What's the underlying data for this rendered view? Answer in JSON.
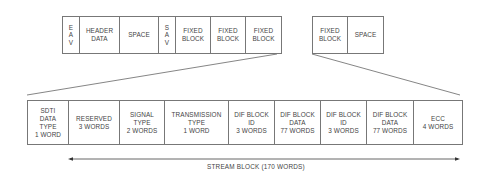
{
  "diagram": {
    "top_row_main": [
      {
        "label": "E\nA\nV",
        "width": 17
      },
      {
        "label": "HEADER\nDATA",
        "width": 40
      },
      {
        "label": "SPACE",
        "width": 39
      },
      {
        "label": "S\nA\nV",
        "width": 17
      },
      {
        "label": "FIXED\nBLOCK",
        "width": 35
      },
      {
        "label": "FIXED\nBLOCK",
        "width": 35
      },
      {
        "label": "FIXED\nBLOCK",
        "width": 35
      }
    ],
    "top_row_secondary": [
      {
        "label": "FIXED\nBLOCK",
        "width": 35
      },
      {
        "label": "SPACE",
        "width": 35
      }
    ],
    "stream_block_fields": [
      {
        "label": "SDTI\nDATA\nTYPE\n1 WORD",
        "width": 41
      },
      {
        "label": "RESERVED\n3 WORDS",
        "width": 51
      },
      {
        "label": "SIGNAL\nTYPE\n2 WORDS",
        "width": 45
      },
      {
        "label": "TRANSMISSION\nTYPE\n1 WORD",
        "width": 64
      },
      {
        "label": "DIF BLOCK\nID\n3 WORDS",
        "width": 46
      },
      {
        "label": "DIF BLOCK\nDATA\n77 WORDS",
        "width": 46
      },
      {
        "label": "DIF BLOCK\nID\n3 WORDS",
        "width": 46
      },
      {
        "label": "DIF BLOCK\nDATA\n77 WORDS",
        "width": 47
      },
      {
        "label": "ECC\n4 WORDS",
        "width": 48
      }
    ],
    "stream_block_label": "STREAM BLOCK (170 WORDS)",
    "line_color": "#777777"
  }
}
